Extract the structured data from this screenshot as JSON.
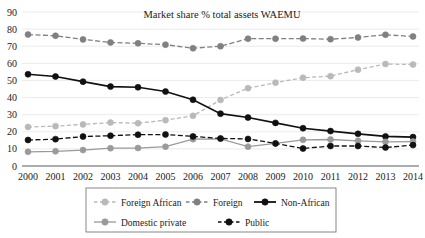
{
  "chart_data": {
    "type": "line",
    "title": "Market share % total assets WAEMU",
    "xlabel": "",
    "ylabel": "",
    "grid": true,
    "legend_position": "bottom",
    "ylim": [
      0,
      90
    ],
    "yticks": [
      0,
      10,
      20,
      30,
      40,
      50,
      60,
      70,
      80,
      90
    ],
    "categories": [
      "2000",
      "2001",
      "2002",
      "2003",
      "2004",
      "2005",
      "2006",
      "2007",
      "2008",
      "2009",
      "2010",
      "2011",
      "2012",
      "2013",
      "2014"
    ],
    "series": [
      {
        "name": "Foreign African",
        "color": "#b9b9b9",
        "dash": "dashed",
        "values": [
          22.8,
          23.3,
          24.3,
          25.4,
          25.0,
          26.8,
          29.3,
          38.6,
          45.5,
          48.7,
          51.6,
          52.5,
          56.3,
          59.6,
          59.3
        ]
      },
      {
        "name": "Foreign",
        "color": "#808080",
        "dash": "dashed",
        "values": [
          76.8,
          76.1,
          74.0,
          72.2,
          71.7,
          70.9,
          68.8,
          70.0,
          74.4,
          74.4,
          74.5,
          74.1,
          75.1,
          76.7,
          75.7
        ]
      },
      {
        "name": "Non-African",
        "color": "#111111",
        "dash": "solid",
        "values": [
          53.6,
          52.3,
          49.3,
          46.4,
          46.0,
          43.5,
          38.7,
          30.6,
          28.3,
          25.2,
          22.1,
          20.4,
          18.8,
          17.3,
          16.9
        ]
      },
      {
        "name": "Domestic private",
        "color": "#9a9a9a",
        "dash": "solid",
        "values": [
          8.3,
          8.6,
          9.3,
          10.4,
          10.5,
          11.3,
          15.7,
          15.9,
          11.3,
          13.2,
          15.3,
          15.5,
          14.7,
          14.1,
          14.3
        ]
      },
      {
        "name": "Public",
        "color": "#111111",
        "dash": "dashed",
        "values": [
          15.2,
          15.7,
          17.2,
          17.7,
          18.3,
          18.4,
          17.3,
          16.1,
          15.8,
          13.2,
          10.2,
          11.7,
          11.7,
          10.8,
          12.2
        ]
      }
    ]
  },
  "legend": {
    "items": [
      {
        "label": "Foreign African"
      },
      {
        "label": "Foreign"
      },
      {
        "label": "Non-African"
      },
      {
        "label": "Domestic private"
      },
      {
        "label": "Public"
      }
    ]
  }
}
